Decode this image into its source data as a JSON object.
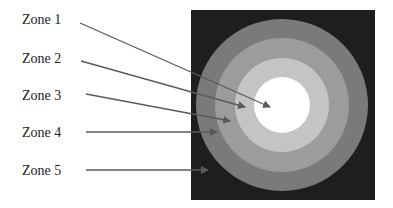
{
  "diagram": {
    "type": "concentric-zones",
    "background_color": "#1e1e1e",
    "line_color": "#5a5a5a",
    "center": {
      "x": 282,
      "y": 105
    },
    "zones": [
      {
        "label": "Zone 1",
        "radius": 28,
        "fill": "#ffffff",
        "label_pos": {
          "x": 22,
          "y": 12
        },
        "line": {
          "x1": 80,
          "y1": 23,
          "x2": 270,
          "y2": 107
        }
      },
      {
        "label": "Zone 2",
        "radius": 47,
        "fill": "#c4c4c4",
        "label_pos": {
          "x": 22,
          "y": 51
        },
        "line": {
          "x1": 81,
          "y1": 61,
          "x2": 245,
          "y2": 107
        }
      },
      {
        "label": "Zone 3",
        "radius": 67,
        "fill": "#9c9c9c",
        "label_pos": {
          "x": 22,
          "y": 88
        },
        "line": {
          "x1": 86,
          "y1": 94,
          "x2": 230,
          "y2": 121
        }
      },
      {
        "label": "Zone 4",
        "radius": 86,
        "fill": "#7a7a7a",
        "label_pos": {
          "x": 22,
          "y": 125
        },
        "line": {
          "x1": 86,
          "y1": 132,
          "x2": 217,
          "y2": 132
        }
      },
      {
        "label": "Zone 5",
        "radius": null,
        "fill": "#1e1e1e",
        "label_pos": {
          "x": 22,
          "y": 163
        },
        "line": {
          "x1": 86,
          "y1": 170,
          "x2": 208,
          "y2": 170
        }
      }
    ]
  }
}
